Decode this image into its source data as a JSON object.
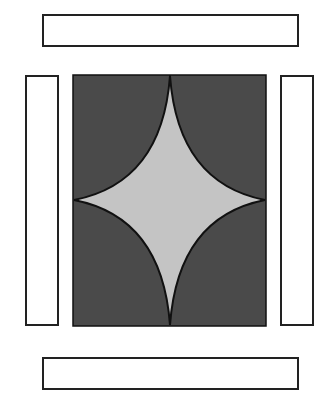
{
  "diagram": {
    "colors": {
      "panel": "#4a4a4a",
      "star": "#c4c4c4",
      "outline": "#111111",
      "bars": "#ffffff"
    },
    "bars": [
      "top",
      "left",
      "right",
      "bottom"
    ]
  }
}
